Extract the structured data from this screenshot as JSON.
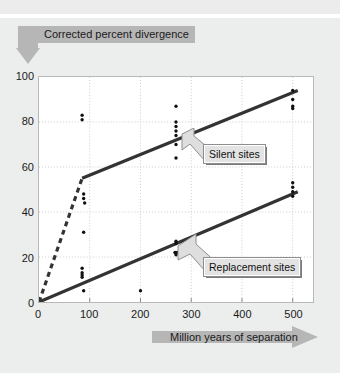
{
  "chart_data": {
    "type": "scatter",
    "title": "",
    "xlabel": "Million years of separation",
    "ylabel": "Corrected percent divergence",
    "xlim": [
      0,
      540
    ],
    "ylim": [
      0,
      100
    ],
    "xticks": [
      0,
      100,
      200,
      300,
      400,
      500
    ],
    "yticks": [
      0,
      20,
      40,
      60,
      80,
      100
    ],
    "grid": true,
    "legend_position": "inside-right",
    "series": [
      {
        "name": "Silent sites",
        "style": "solid-line-with-points",
        "color": "#333333",
        "points": [
          {
            "x": 85,
            "y": 83
          },
          {
            "x": 85,
            "y": 81
          },
          {
            "x": 88,
            "y": 48
          },
          {
            "x": 88,
            "y": 46
          },
          {
            "x": 90,
            "y": 44
          },
          {
            "x": 88,
            "y": 31
          },
          {
            "x": 270,
            "y": 87
          },
          {
            "x": 270,
            "y": 80
          },
          {
            "x": 270,
            "y": 78
          },
          {
            "x": 270,
            "y": 76
          },
          {
            "x": 270,
            "y": 74
          },
          {
            "x": 270,
            "y": 70
          },
          {
            "x": 270,
            "y": 64
          },
          {
            "x": 500,
            "y": 94
          },
          {
            "x": 500,
            "y": 90
          },
          {
            "x": 500,
            "y": 87
          },
          {
            "x": 500,
            "y": 86
          }
        ],
        "fit_line": [
          {
            "x": 85,
            "y": 55
          },
          {
            "x": 510,
            "y": 94
          }
        ],
        "dashed_segment": [
          {
            "x": 0,
            "y": 0
          },
          {
            "x": 85,
            "y": 55
          }
        ]
      },
      {
        "name": "Replacement sites",
        "style": "solid-line-with-points",
        "color": "#333333",
        "points": [
          {
            "x": 85,
            "y": 15
          },
          {
            "x": 85,
            "y": 13
          },
          {
            "x": 85,
            "y": 12
          },
          {
            "x": 85,
            "y": 11
          },
          {
            "x": 88,
            "y": 5
          },
          {
            "x": 200,
            "y": 5
          },
          {
            "x": 270,
            "y": 27
          },
          {
            "x": 270,
            "y": 26
          },
          {
            "x": 268,
            "y": 22
          },
          {
            "x": 272,
            "y": 22
          },
          {
            "x": 270,
            "y": 21
          },
          {
            "x": 500,
            "y": 53
          },
          {
            "x": 500,
            "y": 51
          },
          {
            "x": 500,
            "y": 49
          },
          {
            "x": 500,
            "y": 47
          }
        ],
        "fit_line": [
          {
            "x": 0,
            "y": 0
          },
          {
            "x": 510,
            "y": 49
          }
        ]
      }
    ]
  },
  "axes": {
    "y_label": "Corrected percent divergence",
    "x_label": "Million years of separation",
    "y_tick_labels": [
      "100",
      "80",
      "60",
      "40",
      "20",
      "0"
    ],
    "x_tick_labels": [
      "0",
      "100",
      "200",
      "300",
      "400",
      "500"
    ]
  },
  "callouts": {
    "silent": "Silent sites",
    "replacement": "Replacement sites"
  },
  "colors": {
    "panel_background": "#eceded",
    "plot_background": "#ffffff",
    "line": "#333333",
    "banner": "#b6b6b6",
    "callout_fill": "#e3e3e3",
    "grid": "#cccccc"
  }
}
